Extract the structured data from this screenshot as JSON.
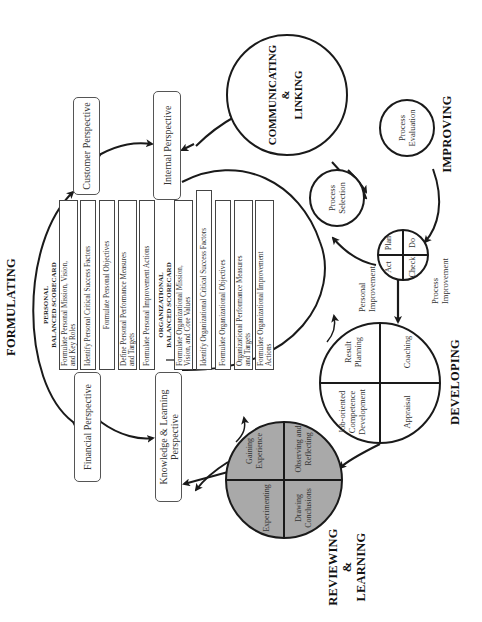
{
  "phases": {
    "formulating": "FORMULATING",
    "communicating": [
      "COMMUNICATING",
      "&",
      "LINKING"
    ],
    "improving": "IMPROVING",
    "developing": "DEVELOPING",
    "reviewing": [
      "REVIEWING",
      "&",
      "LEARNING"
    ]
  },
  "perspectives": {
    "customer": "Customer Perspective",
    "internal": "Internal Perspective",
    "financial": "Financial Perspective",
    "knowledge": [
      "Knowledge & Learning",
      "Perspective"
    ]
  },
  "personal_scorecard": {
    "heading": [
      "PERSONAL",
      "BALANCED SCORECARD"
    ],
    "steps": [
      [
        "Formulate Personal Mission, Vision,",
        "and Key Roles"
      ],
      [
        "Identify Personal Critical Success Factors"
      ],
      [
        "Formulate Personal Objectives"
      ],
      [
        "Define Personal Performance Measures",
        "and Targets"
      ],
      [
        "Formulate Personal Improvement Actions"
      ]
    ]
  },
  "organizational_scorecard": {
    "heading": [
      "ORGANIZATIONAL",
      "BALANCED SCORECARD"
    ],
    "steps": [
      [
        "Formulate Organizational Mission,",
        "Vision, and Core Values"
      ],
      [
        "Identify Organizational Critical Success Factors"
      ],
      [
        "Formulate Organizational Objectives"
      ],
      [
        "Organizational Performance Measures",
        "and Targets"
      ],
      [
        "Formulate Organizational Improvement",
        "Actions"
      ]
    ]
  },
  "improving_cycle": {
    "process_selection": [
      "Process",
      "Selection"
    ],
    "process_evaluation": [
      "Process",
      "Evaluation"
    ],
    "pdca": {
      "plan": "Plan",
      "do": "Do",
      "check": "Check",
      "act": "Act"
    },
    "process_improvement": [
      "Process",
      "Improvement"
    ],
    "personal_improvement": [
      "Personal",
      "Improvement"
    ]
  },
  "developing_cycle": {
    "result_planning": [
      "Result",
      "Planning"
    ],
    "coaching": "Coaching",
    "appraisal": "Appraisal",
    "competence_development": [
      "Job-oriented",
      "Competence",
      "Development"
    ]
  },
  "learning_cycle": {
    "gaining_experience": [
      "Gaining",
      "Experience"
    ],
    "observing_reflecting": [
      "Observing and",
      "Reflecting"
    ],
    "drawing_conclusions": [
      "Drawing",
      "Conclusions"
    ],
    "experimenting": "Experimenting"
  },
  "colors": {
    "line": "#1a1a1a",
    "learning_fill": "#a9a9a9",
    "box_border": "#555555"
  }
}
